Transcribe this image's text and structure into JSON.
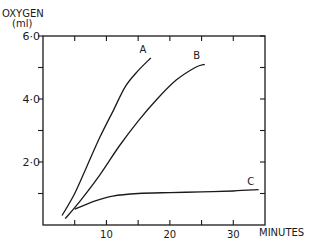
{
  "chart_data": {
    "type": "line",
    "title": "",
    "ylabel": "OXYGEN",
    "ylabel_units": "(ml)",
    "xlabel": "MINUTES",
    "xlim": [
      0,
      35
    ],
    "ylim": [
      0,
      6.0
    ],
    "x_ticks": [
      5,
      10,
      15,
      20,
      25,
      30
    ],
    "x_tick_labels": [
      "10",
      "20",
      "30"
    ],
    "x_tick_label_values": [
      10,
      20,
      30
    ],
    "y_ticks": [
      1.0,
      2.0,
      3.0,
      4.0,
      5.0,
      6.0
    ],
    "y_tick_labels": [
      "2·0",
      "4·0",
      "6·0"
    ],
    "y_tick_label_values": [
      2.0,
      4.0,
      6.0
    ],
    "grid": false,
    "frame": "box with ticks on all sides",
    "legend": "none; curves labeled directly at ends",
    "series": [
      {
        "name": "A",
        "x": [
          3,
          5,
          7,
          9,
          11,
          13,
          15,
          17
        ],
        "values": [
          0.3,
          1.0,
          1.9,
          2.8,
          3.6,
          4.4,
          4.9,
          5.3
        ]
      },
      {
        "name": "B",
        "x": [
          3.5,
          6,
          9,
          12,
          15,
          18,
          21,
          24,
          25.5
        ],
        "values": [
          0.2,
          0.8,
          1.6,
          2.5,
          3.3,
          4.0,
          4.6,
          5.0,
          5.1
        ]
      },
      {
        "name": "C",
        "x": [
          5,
          8,
          11,
          15,
          20,
          25,
          30,
          34
        ],
        "values": [
          0.5,
          0.75,
          0.92,
          1.0,
          1.03,
          1.05,
          1.08,
          1.12
        ]
      }
    ]
  }
}
